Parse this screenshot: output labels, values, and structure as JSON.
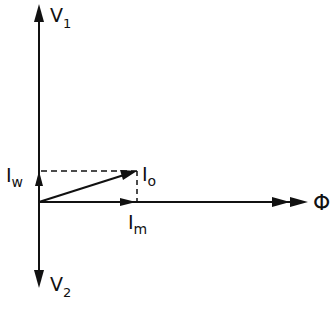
{
  "diagram": {
    "type": "phasor-diagram",
    "labels": {
      "v1": {
        "main": "V",
        "sub": "1"
      },
      "v2": {
        "main": "V",
        "sub": "2"
      },
      "iw": {
        "main": "I",
        "sub": "w"
      },
      "io": {
        "main": "I",
        "sub": "o"
      },
      "im": {
        "main": "I",
        "sub": "m"
      },
      "phi": "Φ"
    },
    "colors": {
      "ink": "#111111",
      "background": "#ffffff"
    }
  }
}
